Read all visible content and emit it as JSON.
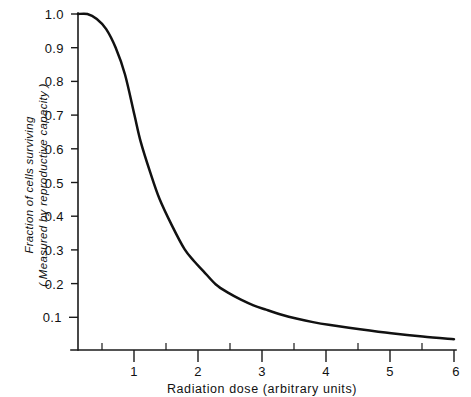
{
  "chart_data": {
    "type": "line",
    "title": "",
    "xlabel": "Radiation dose  (arbitrary units)",
    "ylabel_line1": "Fraction of cells surviving",
    "ylabel_line2": "( Measured by reproductive capacity )",
    "xlim": [
      0,
      6
    ],
    "ylim": [
      0,
      1.0
    ],
    "grid": false,
    "legend": "none",
    "line_color": "#111111",
    "x_major_ticks": [
      1,
      2,
      3,
      4,
      5,
      6
    ],
    "x_major_tick_labels": [
      "1",
      "2",
      "3",
      "4",
      "5",
      "6"
    ],
    "x_minor_ticks": [
      0.5,
      1.5,
      2.5,
      3.5,
      4.5,
      5.5
    ],
    "y_major_ticks": [
      0.1,
      0.2,
      0.3,
      0.4,
      0.5,
      0.6,
      0.7,
      0.8,
      0.9,
      1.0
    ],
    "y_major_tick_labels": [
      "0.1",
      "0.2",
      "0.3",
      "0.4",
      "0.5",
      "0.6",
      "0.7",
      "0.8",
      "0.9",
      "1.0"
    ],
    "series": [
      {
        "name": "cell survival curve",
        "x": [
          0,
          0.15,
          0.3,
          0.45,
          0.6,
          0.75,
          0.9,
          1.0,
          1.15,
          1.3,
          1.5,
          1.7,
          1.85,
          2.0,
          2.2,
          2.4,
          2.6,
          2.8,
          3.0,
          3.25,
          3.5,
          3.75,
          4.0,
          4.5,
          5.0,
          5.5,
          6.0
        ],
        "y": [
          1.0,
          1.0,
          0.985,
          0.955,
          0.9,
          0.82,
          0.7,
          0.62,
          0.53,
          0.45,
          0.37,
          0.3,
          0.265,
          0.235,
          0.195,
          0.17,
          0.15,
          0.133,
          0.12,
          0.105,
          0.093,
          0.083,
          0.075,
          0.062,
          0.05,
          0.04,
          0.032
        ]
      }
    ]
  },
  "axis": {
    "x_label": "Radiation dose  (arbitrary units)",
    "y_label_1": "Fraction of cells surviving",
    "y_label_2": "( Measured by reproductive capacity )"
  }
}
